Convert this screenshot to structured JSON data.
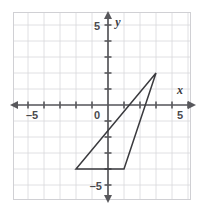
{
  "figure": {
    "name": "coordinate-plane-triangle",
    "background_color": "#ffffff",
    "grid_color": "#d8d8dc",
    "axis_color": "#58585c",
    "shape_color": "#3a3a3e"
  },
  "axes": {
    "x_label": "x",
    "y_label": "y",
    "origin_label": "0",
    "x_tick_labels": [
      {
        "value": -5,
        "text": "–5"
      },
      {
        "value": 5,
        "text": "5"
      }
    ],
    "y_tick_labels": [
      {
        "value": 5,
        "text": "5"
      },
      {
        "value": -5,
        "text": "–5"
      }
    ]
  },
  "chart_data": {
    "type": "scatter",
    "title": "",
    "xlabel": "x",
    "ylabel": "y",
    "xlim": [
      -6,
      6
    ],
    "ylim": [
      -6,
      6
    ],
    "grid": true,
    "legend": "none",
    "x_ticks": [
      -5,
      -4,
      -3,
      -2,
      -1,
      0,
      1,
      2,
      3,
      4,
      5
    ],
    "y_ticks": [
      -5,
      -4,
      -3,
      -2,
      -1,
      0,
      1,
      2,
      3,
      4,
      5
    ],
    "labeled_x_ticks": [
      -5,
      5
    ],
    "labeled_y_ticks": [
      5,
      -5
    ],
    "shapes": [
      {
        "name": "triangle",
        "closed": true,
        "filled": false,
        "vertices": [
          {
            "x": 3,
            "y": 2
          },
          {
            "x": -2,
            "y": -4
          },
          {
            "x": 1,
            "y": -4
          }
        ]
      }
    ]
  }
}
